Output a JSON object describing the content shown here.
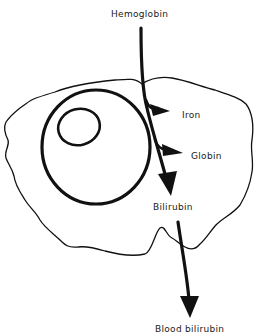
{
  "diagram": {
    "type": "process-diagram",
    "labels": {
      "hemoglobin": "Hemoglobin",
      "iron": "Iron",
      "globin": "Globin",
      "bilirubin": "Bilirubin",
      "blood_bilirubin": "Blood bilirubin"
    },
    "colors": {
      "ink": "#111111",
      "background": "#ffffff"
    },
    "nodes": [
      {
        "id": "hemoglobin",
        "label": "Hemoglobin"
      },
      {
        "id": "iron",
        "label": "Iron"
      },
      {
        "id": "globin",
        "label": "Globin"
      },
      {
        "id": "bilirubin",
        "label": "Bilirubin"
      },
      {
        "id": "blood_bilirubin",
        "label": "Blood bilirubin"
      }
    ],
    "edges": [
      {
        "from": "hemoglobin",
        "to": "bilirubin"
      },
      {
        "from": "hemoglobin",
        "to": "iron"
      },
      {
        "from": "hemoglobin",
        "to": "globin"
      },
      {
        "from": "bilirubin",
        "to": "blood_bilirubin"
      }
    ],
    "shapes": [
      "cell-membrane",
      "nucleus",
      "nucleolus"
    ]
  }
}
